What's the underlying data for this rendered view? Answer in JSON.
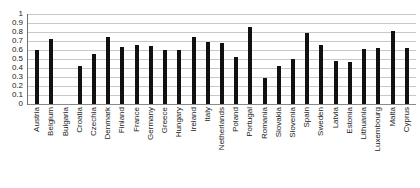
{
  "chart_data": {
    "type": "bar",
    "title": "",
    "xlabel": "",
    "ylabel": "",
    "ylim": [
      0,
      1
    ],
    "yticks": [
      "0",
      "0.1",
      "0.2",
      "0.3",
      "0.4",
      "0.5",
      "0.6",
      "0.7",
      "0.8",
      "0.9",
      "1"
    ],
    "grid": true,
    "legend": "none",
    "bar_color": "#111111",
    "gridline_color": "#c8c8c8",
    "categories": [
      "Austria",
      "Belgium",
      "Bulgaria",
      "Croatia",
      "Czechia",
      "Denmark",
      "Finland",
      "France",
      "Germany",
      "Greece",
      "Hungary",
      "Ireland",
      "Italy",
      "Netherlands",
      "Poland",
      "Portugal",
      "Romania",
      "Slovakia",
      "Slovenia",
      "Spain",
      "Sweden",
      "Latvia",
      "Estonia",
      "Lithuania",
      "Luxembourg",
      "Malta",
      "Cyprus"
    ],
    "values": [
      0.6,
      0.72,
      null,
      0.42,
      0.56,
      0.75,
      0.635,
      0.66,
      0.645,
      0.6,
      0.595,
      0.74,
      0.685,
      0.68,
      0.52,
      0.855,
      0.285,
      0.42,
      0.5,
      0.79,
      0.655,
      0.475,
      0.47,
      0.61,
      0.625,
      0.815,
      0.62
    ]
  }
}
